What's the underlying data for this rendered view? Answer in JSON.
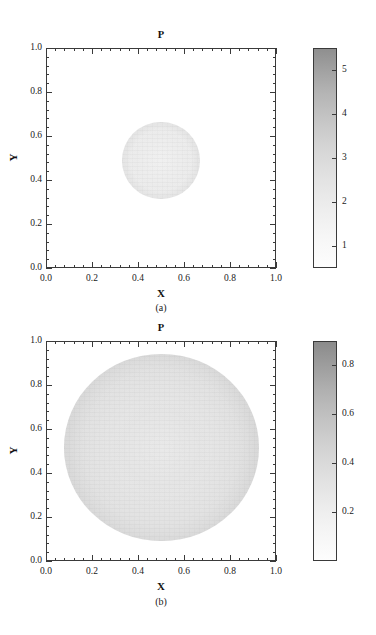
{
  "figure": {
    "panels": [
      {
        "caption": "(a)",
        "title": "P",
        "xlabel": "X",
        "ylabel": "Y",
        "xticks": [
          "0.0",
          "0.2",
          "0.4",
          "0.6",
          "0.8",
          "1.0"
        ],
        "yticks": [
          "0.0",
          "0.2",
          "0.4",
          "0.6",
          "0.8",
          "1.0"
        ],
        "colorbar_ticks": [
          "1",
          "2",
          "3",
          "4",
          "5"
        ]
      },
      {
        "caption": "(b)",
        "title": "P",
        "xlabel": "X",
        "ylabel": "Y",
        "xticks": [
          "0.0",
          "0.2",
          "0.4",
          "0.6",
          "0.8",
          "1.0"
        ],
        "yticks": [
          "0.0",
          "0.2",
          "0.4",
          "0.6",
          "0.8",
          "1.0"
        ],
        "colorbar_ticks": [
          "0.2",
          "0.4",
          "0.6",
          "0.8"
        ]
      }
    ]
  },
  "chart_data": [
    {
      "type": "heatmap",
      "title": "P",
      "subtitle": "(a)",
      "xlabel": "X",
      "ylabel": "Y",
      "xlim": [
        0.0,
        1.0
      ],
      "ylim": [
        0.0,
        1.0
      ],
      "xticks": [
        0.0,
        0.2,
        0.4,
        0.6,
        0.8,
        1.0
      ],
      "yticks": [
        0.0,
        0.2,
        0.4,
        0.6,
        0.8,
        1.0
      ],
      "minor_ticks_per_interval": 4,
      "grid": false,
      "colormap": "grayscale-inverted",
      "colorbar": {
        "position": "right",
        "ticks": [
          1,
          2,
          3,
          4,
          5
        ],
        "range": [
          0.5,
          5.5
        ]
      },
      "field": {
        "description": "Circular high-pressure droplet centered in domain on uniform low background",
        "shape": "circle",
        "center": [
          0.5,
          0.5
        ],
        "radius": 0.17,
        "interior_value": 1.2,
        "rim_value": 2.1,
        "background_value": 0.6
      }
    },
    {
      "type": "heatmap",
      "title": "P",
      "subtitle": "(b)",
      "xlabel": "X",
      "ylabel": "Y",
      "xlim": [
        0.0,
        1.0
      ],
      "ylim": [
        0.0,
        1.0
      ],
      "xticks": [
        0.0,
        0.2,
        0.4,
        0.6,
        0.8,
        1.0
      ],
      "yticks": [
        0.0,
        0.2,
        0.4,
        0.6,
        0.8,
        1.0
      ],
      "minor_ticks_per_interval": 4,
      "grid": false,
      "colormap": "grayscale-inverted",
      "colorbar": {
        "position": "right",
        "ticks": [
          0.2,
          0.4,
          0.6,
          0.8
        ],
        "range": [
          0.0,
          0.9
        ]
      },
      "field": {
        "description": "Large circular droplet nearly filling domain on white background",
        "shape": "circle",
        "center": [
          0.505,
          0.51
        ],
        "radius": 0.425,
        "interior_value": 0.18,
        "rim_value": 0.35,
        "background_value": 0.0
      }
    }
  ]
}
